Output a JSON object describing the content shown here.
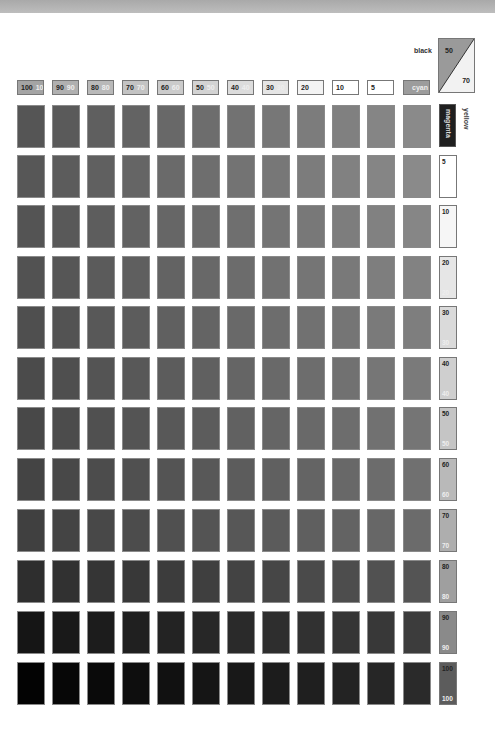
{
  "header_row": {
    "labels": [
      {
        "a": "100",
        "b": "100"
      },
      {
        "a": "90",
        "b": "90"
      },
      {
        "a": "80",
        "b": "80"
      },
      {
        "a": "70",
        "b": "70"
      },
      {
        "a": "60",
        "b": "60"
      },
      {
        "a": "50",
        "b": "50"
      },
      {
        "a": "40",
        "b": "40"
      },
      {
        "a": "30",
        "b": "30"
      },
      {
        "a": "20",
        "b": ""
      },
      {
        "a": "10",
        "b": ""
      },
      {
        "a": "5",
        "b": ""
      },
      {
        "a": "",
        "b": "cyan"
      }
    ]
  },
  "corner": {
    "black_label": "black",
    "triangle_top": "50",
    "triangle_bottom": "70",
    "yellow_label": "yellow"
  },
  "side_column": {
    "magenta_label": "magenta",
    "items": [
      {
        "t": "5",
        "b": ""
      },
      {
        "t": "10",
        "b": ""
      },
      {
        "t": "20",
        "b": "20"
      },
      {
        "t": "30",
        "b": "30"
      },
      {
        "t": "40",
        "b": "40"
      },
      {
        "t": "50",
        "b": "50"
      },
      {
        "t": "60",
        "b": "60"
      },
      {
        "t": "70",
        "b": "70"
      },
      {
        "t": "80",
        "b": "80"
      },
      {
        "t": "90",
        "b": "90"
      },
      {
        "t": "100",
        "b": "100"
      }
    ]
  },
  "colors": {
    "header_fills": [
      "#a4a4a4",
      "#b0b0b0",
      "#b9b9b9",
      "#c3c3c3",
      "#cbcbcb",
      "#d3d3d3",
      "#dcdcdc",
      "#e5e5e5",
      "#f3f3f3",
      "#ffffff",
      "#ffffff",
      "#9c9c9c"
    ],
    "side_fills": [
      "#ffffff",
      "#f6f6f6",
      "#e6e6e6",
      "#dadada",
      "#cfcfcf",
      "#c5c5c5",
      "#b9b9b9",
      "#aeaeae",
      "#9f9f9f",
      "#8a8a8a",
      "#5c5c5c"
    ],
    "row_base_dark": [
      "#555555",
      "#575757",
      "#545454",
      "#525252",
      "#4f4f4f",
      "#4b4b4b",
      "#484848",
      "#444444",
      "#404040",
      "#2e2e2e",
      "#151515",
      "#030303"
    ],
    "row_base_light": [
      "#8a8a8a",
      "#8a8a8a",
      "#868686",
      "#828282",
      "#7e7e7e",
      "#7a7a7a",
      "#757575",
      "#707070",
      "#6b6b6b",
      "#545454",
      "#3c3c3c",
      "#2a2a2a"
    ]
  }
}
